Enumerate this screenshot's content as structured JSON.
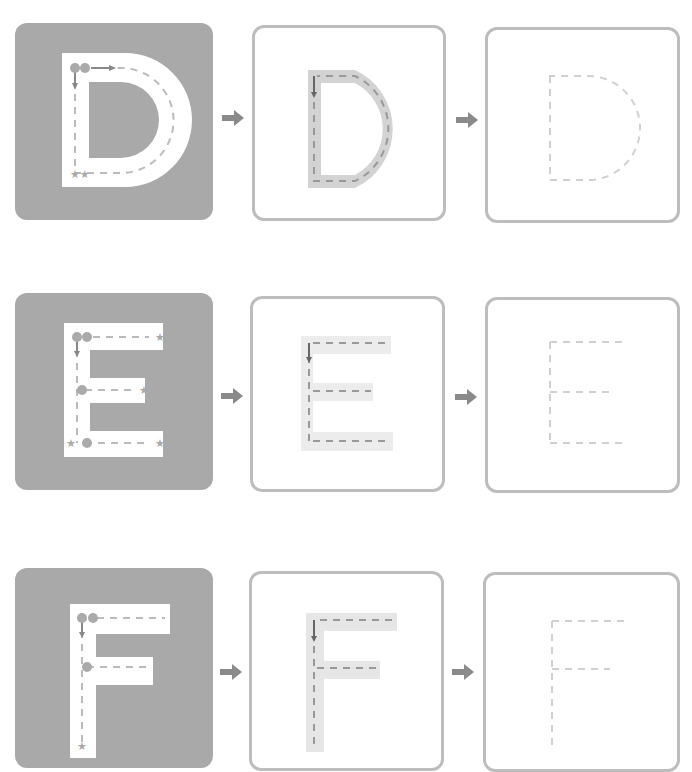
{
  "worksheet": {
    "rows": [
      {
        "letter": "D",
        "step1": "Trace with guides",
        "step2": "Trace shaded",
        "step3": "Trace dashed"
      },
      {
        "letter": "E",
        "step1": "Trace with guides",
        "step2": "Trace shaded",
        "step3": "Trace dashed"
      },
      {
        "letter": "F",
        "step1": "Trace with guides",
        "step2": "Trace shaded",
        "step3": "Trace dashed"
      }
    ],
    "stroke_numbers": {
      "D": [
        "1",
        "2"
      ],
      "E": [
        "1",
        "2",
        "3",
        "4"
      ],
      "F": [
        "1",
        "2",
        "3"
      ]
    },
    "icons": {
      "start": "numbered-circle-icon",
      "end": "star-icon",
      "next": "arrow-right-icon"
    },
    "colors": {
      "solid_bg": "#a9a9a9",
      "outline_border": "#bdbdbd",
      "shade": "#d3d3d3",
      "guide_dash": "#b5b5b5",
      "faint_dash": "#d0d0d0",
      "arrow": "#8a8a8a"
    }
  }
}
